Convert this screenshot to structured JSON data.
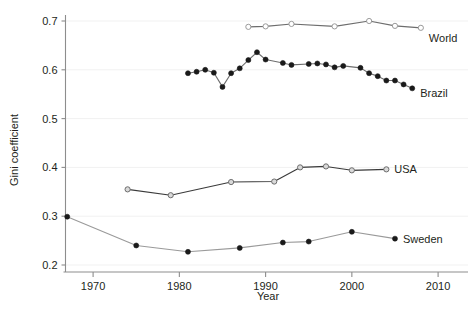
{
  "chart_data": {
    "type": "line",
    "title": "",
    "xlabel": "Year",
    "ylabel": "Gini coefficient",
    "xlim": [
      1965,
      2011
    ],
    "ylim": [
      0.19,
      0.715
    ],
    "xticks": [
      1970,
      1980,
      1990,
      2000,
      2010
    ],
    "xtick_labels": [
      "1970",
      "1980",
      "1990",
      "2000",
      "2010"
    ],
    "yticks": [
      0.2,
      0.3,
      0.4,
      0.5,
      0.6,
      0.7
    ],
    "ytick_labels": [
      "0.2",
      "0.3",
      "0.4",
      "0.5",
      "0.6",
      "0.7"
    ],
    "grid": "horizontal-faint",
    "legend_position": "right-of-line-end",
    "series": [
      {
        "name": "World",
        "label": "World",
        "marker": "open-circle",
        "marker_fill": "#ffffff",
        "marker_stroke": "#9a9a9a",
        "line_color": "#6d6d6d",
        "x": [
          1988,
          1990,
          1993,
          1998,
          2002,
          2005,
          2008
        ],
        "y": [
          0.688,
          0.689,
          0.694,
          0.689,
          0.7,
          0.69,
          0.686
        ]
      },
      {
        "name": "Brazil",
        "label": "Brazil",
        "marker": "filled-circle",
        "marker_fill": "#1a1a1a",
        "marker_stroke": "#1a1a1a",
        "line_color": "#6d6d6d",
        "x": [
          1981,
          1982,
          1983,
          1984,
          1985,
          1986,
          1987,
          1988,
          1989,
          1990,
          1992,
          1993,
          1995,
          1996,
          1997,
          1998,
          1999,
          2001,
          2002,
          2003,
          2004,
          2005,
          2006,
          2007
        ],
        "y": [
          0.593,
          0.596,
          0.6,
          0.594,
          0.565,
          0.593,
          0.603,
          0.62,
          0.636,
          0.621,
          0.614,
          0.61,
          0.612,
          0.613,
          0.611,
          0.605,
          0.608,
          0.604,
          0.593,
          0.587,
          0.578,
          0.578,
          0.57,
          0.562
        ]
      },
      {
        "name": "USA",
        "label": "USA",
        "marker": "open-circle",
        "marker_fill": "#d9d9d9",
        "marker_stroke": "#6d6d6d",
        "line_color": "#3a3a3a",
        "x": [
          1974,
          1979,
          1986,
          1991,
          1994,
          1997,
          2000,
          2004
        ],
        "y": [
          0.355,
          0.343,
          0.37,
          0.371,
          0.4,
          0.402,
          0.394,
          0.396
        ]
      },
      {
        "name": "Sweden",
        "label": "Sweden",
        "marker": "filled-circle",
        "marker_fill": "#1a1a1a",
        "marker_stroke": "#1a1a1a",
        "line_color": "#9a9a9a",
        "x": [
          1967,
          1975,
          1981,
          1987,
          1992,
          1995,
          2000,
          2005
        ],
        "y": [
          0.299,
          0.24,
          0.227,
          0.235,
          0.246,
          0.248,
          0.268,
          0.254
        ]
      }
    ]
  },
  "footer": {
    "ghost_text": ""
  }
}
